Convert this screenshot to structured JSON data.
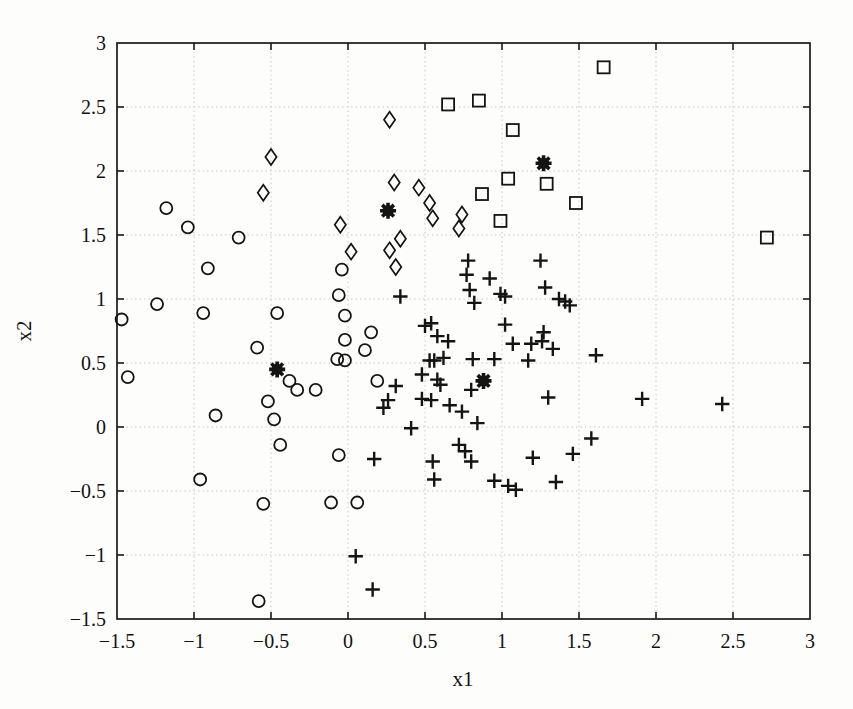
{
  "figure": {
    "background": "#fdfdfc",
    "axis_color": "#1a1a1a",
    "grid_color": "#c9c9c9",
    "marker_color": "#141414"
  },
  "chart_data": {
    "type": "scatter",
    "title": "",
    "xlabel": "x1",
    "ylabel": "x2",
    "xlim": [
      -1.5,
      3
    ],
    "ylim": [
      -1.5,
      3
    ],
    "grid": true,
    "legend": "none",
    "xticks": [
      -1.5,
      -1,
      -0.5,
      0,
      0.5,
      1,
      1.5,
      2,
      2.5,
      3
    ],
    "yticks": [
      -1.5,
      -1,
      -0.5,
      0,
      0.5,
      1,
      1.5,
      2,
      2.5,
      3
    ],
    "xtick_labels": [
      "−1.5",
      "−1",
      "−0.5",
      "0",
      "0.5",
      "1",
      "1.5",
      "2",
      "2.5",
      "3"
    ],
    "ytick_labels": [
      "−1.5",
      "−1",
      "−0.5",
      "0",
      "0.5",
      "1",
      "1.5",
      "2",
      "2.5",
      "3"
    ],
    "series": [
      {
        "name": "cluster-circles",
        "marker": "circle",
        "points": [
          [
            -1.18,
            1.71
          ],
          [
            -1.04,
            1.56
          ],
          [
            -0.71,
            1.48
          ],
          [
            -0.91,
            1.24
          ],
          [
            -1.24,
            0.96
          ],
          [
            -0.94,
            0.89
          ],
          [
            -1.47,
            0.84
          ],
          [
            -0.46,
            0.89
          ],
          [
            -1.43,
            0.39
          ],
          [
            -0.59,
            0.62
          ],
          [
            -0.86,
            0.09
          ],
          [
            -0.52,
            0.2
          ],
          [
            -0.48,
            0.06
          ],
          [
            -0.38,
            0.36
          ],
          [
            -0.33,
            0.29
          ],
          [
            -0.21,
            0.29
          ],
          [
            -0.04,
            1.23
          ],
          [
            -0.06,
            1.03
          ],
          [
            -0.02,
            0.87
          ],
          [
            -0.02,
            0.68
          ],
          [
            -0.07,
            0.53
          ],
          [
            -0.02,
            0.52
          ],
          [
            0.15,
            0.74
          ],
          [
            0.11,
            0.6
          ],
          [
            0.19,
            0.36
          ],
          [
            -0.44,
            -0.14
          ],
          [
            -0.06,
            -0.22
          ],
          [
            -0.96,
            -0.41
          ],
          [
            -0.55,
            -0.6
          ],
          [
            -0.11,
            -0.59
          ],
          [
            0.06,
            -0.59
          ],
          [
            -0.58,
            -1.36
          ]
        ]
      },
      {
        "name": "cluster-diamonds",
        "marker": "diamond",
        "points": [
          [
            -0.5,
            2.11
          ],
          [
            -0.55,
            1.83
          ],
          [
            0.27,
            2.4
          ],
          [
            0.3,
            1.91
          ],
          [
            0.46,
            1.87
          ],
          [
            0.53,
            1.75
          ],
          [
            0.74,
            1.66
          ],
          [
            0.72,
            1.55
          ],
          [
            0.55,
            1.63
          ],
          [
            -0.05,
            1.58
          ],
          [
            0.34,
            1.47
          ],
          [
            0.02,
            1.37
          ],
          [
            0.27,
            1.38
          ],
          [
            0.31,
            1.25
          ]
        ]
      },
      {
        "name": "cluster-squares",
        "marker": "square",
        "points": [
          [
            0.65,
            2.52
          ],
          [
            0.85,
            2.55
          ],
          [
            1.07,
            2.32
          ],
          [
            1.66,
            2.81
          ],
          [
            1.04,
            1.94
          ],
          [
            1.29,
            1.9
          ],
          [
            0.87,
            1.82
          ],
          [
            1.48,
            1.75
          ],
          [
            0.99,
            1.61
          ],
          [
            2.72,
            1.48
          ]
        ]
      },
      {
        "name": "cluster-pluses",
        "marker": "plus",
        "points": [
          [
            0.78,
            1.3
          ],
          [
            1.25,
            1.3
          ],
          [
            0.77,
            1.19
          ],
          [
            0.92,
            1.16
          ],
          [
            0.79,
            1.07
          ],
          [
            0.99,
            1.04
          ],
          [
            1.02,
            1.02
          ],
          [
            1.28,
            1.09
          ],
          [
            0.82,
            0.97
          ],
          [
            0.34,
            1.02
          ],
          [
            1.37,
            1.0
          ],
          [
            1.41,
            0.98
          ],
          [
            1.44,
            0.95
          ],
          [
            1.02,
            0.8
          ],
          [
            1.27,
            0.74
          ],
          [
            1.26,
            0.67
          ],
          [
            1.07,
            0.65
          ],
          [
            1.19,
            0.65
          ],
          [
            1.33,
            0.61
          ],
          [
            0.54,
            0.81
          ],
          [
            0.5,
            0.79
          ],
          [
            0.58,
            0.71
          ],
          [
            0.65,
            0.67
          ],
          [
            0.53,
            0.52
          ],
          [
            0.56,
            0.52
          ],
          [
            0.62,
            0.54
          ],
          [
            0.81,
            0.53
          ],
          [
            0.95,
            0.53
          ],
          [
            1.17,
            0.52
          ],
          [
            0.48,
            0.41
          ],
          [
            0.31,
            0.32
          ],
          [
            0.58,
            0.37
          ],
          [
            0.6,
            0.33
          ],
          [
            0.8,
            0.29
          ],
          [
            1.3,
            0.23
          ],
          [
            0.26,
            0.21
          ],
          [
            0.23,
            0.15
          ],
          [
            0.48,
            0.22
          ],
          [
            0.54,
            0.21
          ],
          [
            0.66,
            0.17
          ],
          [
            0.74,
            0.12
          ],
          [
            0.84,
            0.03
          ],
          [
            0.41,
            -0.01
          ],
          [
            1.61,
            0.56
          ],
          [
            1.91,
            0.22
          ],
          [
            2.43,
            0.18
          ],
          [
            1.58,
            -0.09
          ],
          [
            0.17,
            -0.25
          ],
          [
            0.55,
            -0.27
          ],
          [
            0.56,
            -0.41
          ],
          [
            0.72,
            -0.14
          ],
          [
            0.76,
            -0.19
          ],
          [
            0.8,
            -0.27
          ],
          [
            0.95,
            -0.42
          ],
          [
            1.04,
            -0.46
          ],
          [
            1.09,
            -0.49
          ],
          [
            1.2,
            -0.24
          ],
          [
            1.46,
            -0.21
          ],
          [
            1.35,
            -0.43
          ],
          [
            0.05,
            -1.01
          ],
          [
            0.16,
            -1.27
          ]
        ]
      },
      {
        "name": "cluster-centers",
        "marker": "filled-star",
        "points": [
          [
            -0.46,
            0.45
          ],
          [
            0.26,
            1.69
          ],
          [
            0.88,
            0.36
          ],
          [
            1.27,
            2.06
          ]
        ]
      }
    ]
  }
}
